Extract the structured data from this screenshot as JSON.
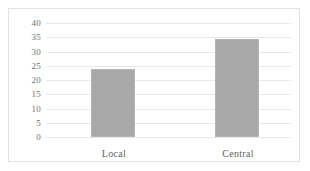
{
  "chart_data": {
    "type": "bar",
    "title": "",
    "subtitle": "",
    "xlabel": "",
    "ylabel": "",
    "categories": [
      "Local",
      "Central"
    ],
    "values": [
      24,
      34.5
    ],
    "series": [
      {
        "name": "",
        "values": [
          24,
          34.5
        ]
      }
    ],
    "ylim": [
      0,
      40
    ],
    "y_ticks": [
      0,
      5,
      10,
      15,
      20,
      25,
      30,
      35,
      40
    ],
    "y_tick_labels": [
      "0",
      "5",
      "10",
      "15",
      "20",
      "25",
      "30",
      "35",
      "40"
    ],
    "grid": true,
    "grid_axis": "y",
    "legend": false,
    "legend_position": "none",
    "annotations": [],
    "colors": {
      "bar_fill": "#a8a8a8",
      "bar_border": "#b4b4b4",
      "gridline": "#e8e8e8",
      "frame_border": "#e2e2e2",
      "plot_background": "#ffffff",
      "tick_label": "#6f6f6f",
      "category_label": "#5f5f5f"
    }
  }
}
